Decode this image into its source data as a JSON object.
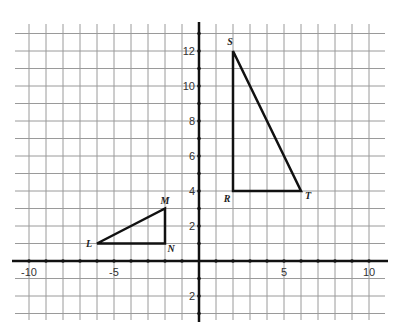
{
  "chart_data": {
    "type": "scatter",
    "title": "",
    "xlabel": "",
    "ylabel": "",
    "xlim": [
      -11,
      11
    ],
    "ylim": [
      -3,
      13
    ],
    "grid": true,
    "x_tick_labels": [
      "-10",
      "-5",
      "5",
      "10"
    ],
    "y_tick_labels": [
      "12",
      "10",
      "8",
      "6",
      "4",
      "2",
      "2"
    ],
    "shapes": [
      {
        "name": "Triangle LMN",
        "vertices": [
          {
            "label": "L",
            "x": -6,
            "y": 1
          },
          {
            "label": "M",
            "x": -2,
            "y": 3
          },
          {
            "label": "N",
            "x": -2,
            "y": 1
          }
        ]
      },
      {
        "name": "Triangle SRT",
        "vertices": [
          {
            "label": "S",
            "x": 2,
            "y": 12
          },
          {
            "label": "R",
            "x": 2,
            "y": 4
          },
          {
            "label": "T",
            "x": 6,
            "y": 4
          }
        ]
      }
    ]
  },
  "colors": {
    "grid": "#9a9a9a",
    "axis": "#111111",
    "shape": "#111111"
  }
}
